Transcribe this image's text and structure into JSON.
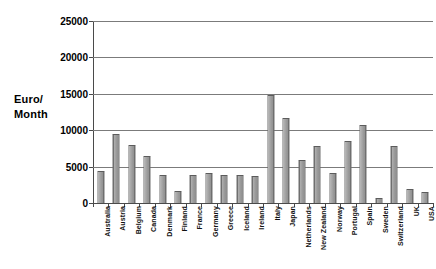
{
  "chart_data": {
    "type": "bar",
    "title": "",
    "subtitle": "",
    "xlabel": "",
    "ylabel": "Euro/ Month",
    "ylabel_lines": [
      "Euro/",
      "Month"
    ],
    "ylim": [
      0,
      25000
    ],
    "ytick_step": 5000,
    "yticks": [
      0,
      5000,
      10000,
      15000,
      20000,
      25000
    ],
    "ytick_labels": [
      "0",
      "5000",
      "10000",
      "15000",
      "20000",
      "25000"
    ],
    "grid": true,
    "grid_axis": "y",
    "legend": false,
    "legend_position": "none",
    "bar_color": "#a0a0a0",
    "bar_edge_color": "#5c5c5c",
    "categories": [
      "Australia",
      "Austria",
      "Belgium",
      "Canada",
      "Denmark",
      "Finland",
      "France",
      "Germany",
      "Greece",
      "Iceland",
      "Ireland",
      "Italy",
      "Japan",
      "Netherlands",
      "New Zealand",
      "Norway",
      "Portugal",
      "Spain",
      "Sweden",
      "Switzerland",
      "UK",
      "USA"
    ],
    "values": [
      4400,
      9500,
      7950,
      6450,
      3800,
      1600,
      3900,
      4150,
      3900,
      3800,
      3750,
      14900,
      11650,
      5950,
      7900,
      4100,
      8450,
      10750,
      750,
      7850,
      1950,
      1550
    ]
  },
  "colors": {
    "bar_fill": "#a0a0a0",
    "bar_edge": "#5c5c5c",
    "gridline": "#7b7b7b",
    "axis": "#4a4a4a",
    "text": "#000000",
    "background": "#ffffff"
  }
}
